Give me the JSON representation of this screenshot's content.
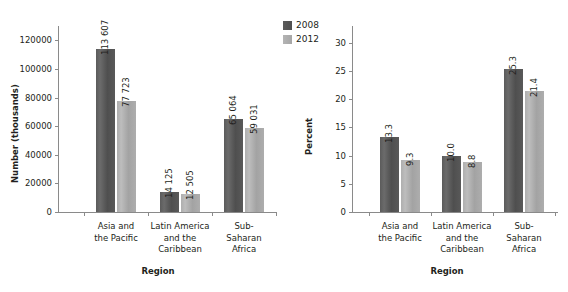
{
  "legend": {
    "position": "top-center",
    "entries": [
      {
        "label": "2008",
        "color": "#555555"
      },
      {
        "label": "2012",
        "color": "#adadad"
      }
    ]
  },
  "chart_data": [
    {
      "id": "left",
      "type": "bar",
      "title": "",
      "xlabel": "Region",
      "ylabel": "Number (thousands)",
      "categories": [
        "Asia and\nthe Pacific",
        "Latin America\nand the\nCaribbean",
        "Sub-\nSaharan\nAfrica"
      ],
      "category_lines": [
        [
          "Asia and",
          "the Pacific"
        ],
        [
          "Latin America",
          "and the",
          "Caribbean"
        ],
        [
          "Sub-",
          "Saharan",
          "Africa"
        ]
      ],
      "series": [
        {
          "name": "2008",
          "values": [
            113607,
            14125,
            65064
          ],
          "labels": [
            "113 607",
            "14 125",
            "65 064"
          ]
        },
        {
          "name": "2012",
          "values": [
            77723,
            12505,
            59031
          ],
          "labels": [
            "77 723",
            "12 505",
            "59 031"
          ]
        }
      ],
      "ylim": [
        0,
        130000
      ],
      "yticks": [
        0,
        20000,
        40000,
        60000,
        80000,
        100000,
        120000
      ],
      "ytick_labels": [
        "0",
        "20000",
        "40000",
        "60000",
        "80000",
        "100000",
        "120000"
      ],
      "grid": false
    },
    {
      "id": "right",
      "type": "bar",
      "title": "",
      "xlabel": "Region",
      "ylabel": "Percent",
      "categories": [
        "Asia and\nthe Pacific",
        "Latin America\nand the\nCaribbean",
        "Sub-\nSaharan\nAfrica"
      ],
      "category_lines": [
        [
          "Asia and",
          "the Pacific"
        ],
        [
          "Latin America",
          "and the",
          "Caribbean"
        ],
        [
          "Sub-",
          "Saharan",
          "Africa"
        ]
      ],
      "series": [
        {
          "name": "2008",
          "values": [
            13.3,
            10.0,
            25.3
          ],
          "labels": [
            "13.3",
            "10.0",
            "25.3"
          ]
        },
        {
          "name": "2012",
          "values": [
            9.3,
            8.8,
            21.4
          ],
          "labels": [
            "9.3",
            "8.8",
            "21.4"
          ]
        }
      ],
      "ylim": [
        0,
        33
      ],
      "yticks": [
        0,
        5,
        10,
        15,
        20,
        25,
        30
      ],
      "ytick_labels": [
        "0",
        "5",
        "10",
        "15",
        "20",
        "25",
        "30"
      ],
      "grid": false
    }
  ]
}
